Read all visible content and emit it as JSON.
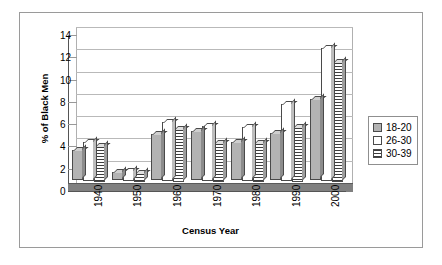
{
  "chart_data": {
    "type": "bar",
    "title": "",
    "xlabel": "Census Year",
    "ylabel": "% of Black Men",
    "categories": [
      "1940",
      "1950",
      "1960",
      "1970",
      "1980",
      "1990",
      "2000"
    ],
    "series": [
      {
        "name": "18-20",
        "values": [
          2.7,
          0.7,
          4.1,
          4.4,
          3.4,
          4.2,
          7.2
        ]
      },
      {
        "name": "26-30",
        "values": [
          3.5,
          0.9,
          5.3,
          4.9,
          4.8,
          6.9,
          11.9
        ]
      },
      {
        "name": "30-39",
        "values": [
          3.2,
          0.8,
          4.8,
          3.5,
          3.5,
          4.9,
          10.8
        ]
      }
    ],
    "ylim": [
      0,
      14
    ],
    "yticks": [
      "0",
      "2",
      "4",
      "6",
      "8",
      "10",
      "12",
      "14"
    ],
    "grid": true,
    "legend_position": "right",
    "style": "3d-clustered-column"
  },
  "legend": {
    "items": [
      {
        "label": "18-20",
        "swatch": "solid-gray"
      },
      {
        "label": "26-30",
        "swatch": "solid-white"
      },
      {
        "label": "30-39",
        "swatch": "horizontal-hatch"
      }
    ]
  },
  "colors": {
    "series_1": "#b3b3b3",
    "series_2": "#ffffff",
    "series_3": "#3d3d3d",
    "floor": "#808080",
    "gridline": "#b9b9b9",
    "axis": "#555555",
    "frame_border": "#9a9a9a"
  }
}
